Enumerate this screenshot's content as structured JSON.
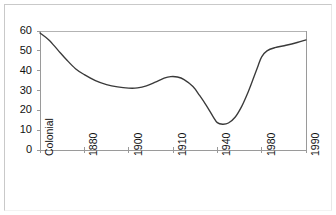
{
  "chart_data": {
    "type": "line",
    "title": "",
    "subtitle": "",
    "xlabel": "",
    "ylabel": "",
    "categories": [
      "Colonial",
      "1880",
      "1900",
      "1910",
      "1940",
      "1980",
      "1990"
    ],
    "x": [
      0,
      1,
      2,
      3,
      4,
      5,
      6
    ],
    "values": [
      59,
      38,
      31,
      36,
      13,
      48,
      55
    ],
    "series": [
      {
        "name": "series-1",
        "values": [
          59,
          38,
          31,
          36,
          13,
          48,
          55
        ],
        "color": "#3a3a3a"
      }
    ],
    "curve_points": [
      {
        "x": 0.0,
        "y": 59.0
      },
      {
        "x": 0.2,
        "y": 55.5
      },
      {
        "x": 0.4,
        "y": 50.5
      },
      {
        "x": 0.6,
        "y": 45.5
      },
      {
        "x": 0.8,
        "y": 41.0
      },
      {
        "x": 1.0,
        "y": 38.0
      },
      {
        "x": 1.25,
        "y": 35.0
      },
      {
        "x": 1.5,
        "y": 33.0
      },
      {
        "x": 1.75,
        "y": 31.8
      },
      {
        "x": 2.0,
        "y": 31.2
      },
      {
        "x": 2.2,
        "y": 31.3
      },
      {
        "x": 2.4,
        "y": 32.3
      },
      {
        "x": 2.6,
        "y": 34.2
      },
      {
        "x": 2.8,
        "y": 36.2
      },
      {
        "x": 2.95,
        "y": 37.0
      },
      {
        "x": 3.1,
        "y": 36.8
      },
      {
        "x": 3.25,
        "y": 35.5
      },
      {
        "x": 3.45,
        "y": 32.0
      },
      {
        "x": 3.6,
        "y": 27.5
      },
      {
        "x": 3.75,
        "y": 22.5
      },
      {
        "x": 3.9,
        "y": 17.0
      },
      {
        "x": 4.0,
        "y": 13.8
      },
      {
        "x": 4.12,
        "y": 13.0
      },
      {
        "x": 4.25,
        "y": 13.6
      },
      {
        "x": 4.4,
        "y": 16.5
      },
      {
        "x": 4.55,
        "y": 22.0
      },
      {
        "x": 4.7,
        "y": 29.5
      },
      {
        "x": 4.82,
        "y": 36.5
      },
      {
        "x": 4.92,
        "y": 42.5
      },
      {
        "x": 5.0,
        "y": 47.0
      },
      {
        "x": 5.12,
        "y": 50.0
      },
      {
        "x": 5.3,
        "y": 51.6
      },
      {
        "x": 5.55,
        "y": 52.8
      },
      {
        "x": 5.8,
        "y": 54.2
      },
      {
        "x": 6.0,
        "y": 55.5
      }
    ],
    "ylim": [
      0,
      60
    ],
    "yticks": [
      0,
      10,
      20,
      30,
      40,
      50,
      60
    ],
    "ytick_labels": [
      "0",
      "10",
      "20",
      "30",
      "40",
      "50",
      "60"
    ],
    "xtick_labels": [
      "Colonial",
      "1880",
      "1900",
      "1910",
      "1940",
      "1980",
      "1990"
    ],
    "xtick_rotation": 90,
    "grid": false,
    "top_rule": true,
    "right_rule": true,
    "legend": null,
    "legend_position": "none",
    "annotations": [],
    "line_color": "#3a3a3a",
    "axis_color": "#8c8c8c",
    "text_color": "#111111"
  }
}
